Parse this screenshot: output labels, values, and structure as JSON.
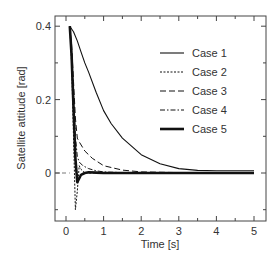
{
  "chart_data": {
    "type": "line",
    "title": "",
    "xlabel": "Time [s]",
    "ylabel": "Satellite attitude [rad]",
    "xlim": [
      -0.3,
      5.3
    ],
    "ylim": [
      -0.13,
      0.427
    ],
    "xticks": [
      0,
      1,
      2,
      3,
      4,
      5
    ],
    "xtick_labels": [
      "0",
      "1",
      "2",
      "3",
      "4",
      "5"
    ],
    "yticks": [
      0,
      0.2,
      0.4
    ],
    "ytick_labels": [
      "0",
      "0.2",
      "0.4"
    ],
    "grid": false,
    "legend_position": "upper right",
    "zero_line": true,
    "series": [
      {
        "name": "Case 1",
        "style": "solid-thin",
        "x": [
          0.1,
          0.2,
          0.3,
          0.4,
          0.5,
          0.6,
          0.8,
          1.0,
          1.2,
          1.5,
          2.0,
          2.5,
          3.0,
          3.5,
          4.0,
          4.5,
          5.0
        ],
        "y": [
          0.4,
          0.385,
          0.36,
          0.33,
          0.3,
          0.275,
          0.22,
          0.17,
          0.135,
          0.095,
          0.05,
          0.025,
          0.012,
          0.007,
          0.006,
          0.006,
          0.006
        ]
      },
      {
        "name": "Case 2",
        "style": "dotted",
        "x": [
          0.1,
          0.15,
          0.2,
          0.25,
          0.3,
          0.35,
          0.4,
          0.5,
          0.6,
          0.8,
          1.0,
          2.0,
          5.0
        ],
        "y": [
          0.4,
          0.3,
          0.1,
          -0.1,
          -0.05,
          0.02,
          0.01,
          0.0,
          0.0,
          0.0,
          0.0,
          0.0,
          0.0
        ]
      },
      {
        "name": "Case 3",
        "style": "long-dash",
        "x": [
          0.1,
          0.15,
          0.2,
          0.25,
          0.3,
          0.35,
          0.5,
          0.7,
          1.0,
          1.5,
          2.0,
          3.0,
          5.0
        ],
        "y": [
          0.4,
          0.35,
          0.25,
          0.15,
          0.095,
          0.085,
          0.06,
          0.04,
          0.02,
          0.008,
          0.003,
          0.001,
          0.0
        ]
      },
      {
        "name": "Case 4",
        "style": "dash-dot",
        "x": [
          0.1,
          0.15,
          0.2,
          0.25,
          0.3,
          0.35,
          0.45,
          0.6,
          0.8,
          1.0,
          1.5,
          2.0,
          5.0
        ],
        "y": [
          0.4,
          0.33,
          0.22,
          0.1,
          0.045,
          0.03,
          0.02,
          0.012,
          0.006,
          0.003,
          0.001,
          0.0,
          0.0
        ]
      },
      {
        "name": "Case 5",
        "style": "solid-thick",
        "x": [
          0.1,
          0.15,
          0.2,
          0.25,
          0.3,
          0.35,
          0.4,
          0.5,
          0.6,
          0.8,
          1.0,
          2.0,
          5.0
        ],
        "y": [
          0.4,
          0.32,
          0.18,
          0.04,
          -0.025,
          -0.015,
          -0.005,
          0.0,
          0.002,
          0.001,
          0.0,
          0.0,
          0.0
        ]
      }
    ]
  },
  "legend": {
    "items": [
      {
        "label": "Case 1"
      },
      {
        "label": "Case 2"
      },
      {
        "label": "Case 3"
      },
      {
        "label": "Case 4"
      },
      {
        "label": "Case 5"
      }
    ]
  }
}
